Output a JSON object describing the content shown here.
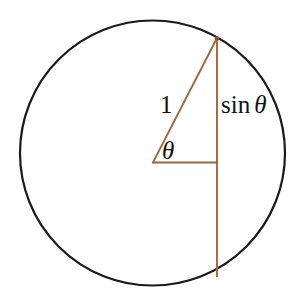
{
  "figure": {
    "name": "unit-circle-sine-diagram",
    "background_color": "#ffffff",
    "width": 297,
    "height": 305
  },
  "colors": {
    "circle_stroke": "#1a1a1a",
    "triangle_stroke": "#a0663c",
    "chord_stroke": "#a0663c",
    "text": "#111111",
    "background": "#ffffff"
  },
  "geometry": {
    "circle": {
      "center_x": 152.5,
      "center_y": 153,
      "radius": 132.5,
      "stroke_width": 2.2
    },
    "vertex": {
      "x": 152.5,
      "y": 162.5
    },
    "apex": {
      "x": 217,
      "y": 38
    },
    "horizontal_end": {
      "x": 217,
      "y": 162.5
    },
    "vertical_bottom": {
      "x": 217,
      "y": 277
    },
    "stroke_width": 1.8
  },
  "labels": {
    "radius": "1",
    "theta_angle": "θ",
    "sine_function": "sin",
    "sine_theta": "θ"
  },
  "chart_data": {
    "type": "diagram",
    "title": "",
    "elements": [
      {
        "name": "circle",
        "role": "unit-circle",
        "center": [
          152.5,
          153
        ],
        "radius": 132.5
      },
      {
        "name": "hypotenuse",
        "role": "radius-of-length-1",
        "from": [
          152.5,
          162.5
        ],
        "to": [
          217,
          38
        ],
        "label": "1"
      },
      {
        "name": "horizontal-leg",
        "role": "cosine-projection",
        "from": [
          152.5,
          162.5
        ],
        "to": [
          217,
          162.5
        ],
        "label": ""
      },
      {
        "name": "vertical-leg",
        "role": "sine-segment",
        "from": [
          217,
          38
        ],
        "to": [
          217,
          277
        ],
        "label": "sin θ"
      },
      {
        "name": "angle-mark",
        "role": "angle-theta",
        "at": [
          152.5,
          162.5
        ],
        "label": "θ"
      }
    ],
    "annotations": [
      "1",
      "θ",
      "sin θ"
    ]
  }
}
